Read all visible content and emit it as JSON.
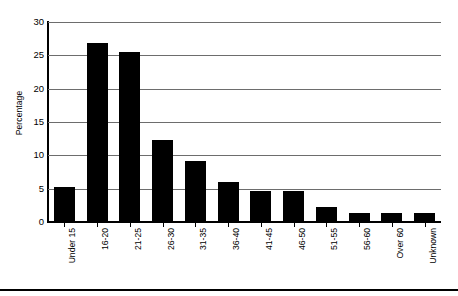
{
  "chart_data": {
    "type": "bar",
    "title": "",
    "subtitle": "",
    "xlabel": "",
    "ylabel": "Percentage",
    "ylim": [
      0,
      30
    ],
    "ytick_values": [
      0,
      5,
      10,
      15,
      20,
      25,
      30
    ],
    "ytick_labels": [
      "0",
      "5",
      "10",
      "15",
      "20",
      "25",
      "30"
    ],
    "grid": "horizontal",
    "legend": "none",
    "bar_color": "#000000",
    "categories": [
      "Under 15",
      "16-20",
      "21-25",
      "26-30",
      "31-35",
      "36-40",
      "41-45",
      "46-50",
      "51-55",
      "56-60",
      "Over 60",
      "Unknown"
    ],
    "values": [
      5.2,
      26.8,
      25.5,
      12.3,
      9.2,
      6.0,
      4.6,
      4.6,
      2.2,
      1.3,
      1.3,
      1.3
    ],
    "xtick_label_rotation": 90,
    "annotations": []
  },
  "axis": {
    "y_title": "Percentage"
  }
}
